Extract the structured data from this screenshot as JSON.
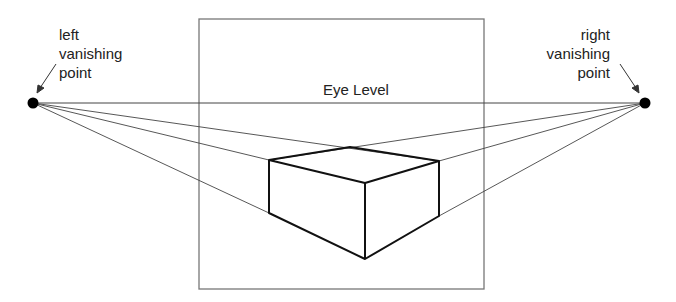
{
  "diagram": {
    "eye_level_label": "Eye Level",
    "left_vp_label": [
      "left",
      "vanishing",
      "point"
    ],
    "right_vp_label": [
      "right",
      "vanishing",
      "point"
    ],
    "colors": {
      "line": "#333333",
      "frame": "#777777",
      "box": "#111111",
      "dot": "#000000"
    }
  }
}
